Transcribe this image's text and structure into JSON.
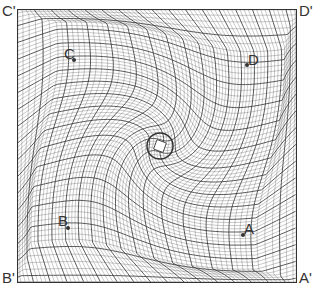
{
  "diagram": {
    "type": "distorted-grid-mesh",
    "colors": {
      "line": "#333333",
      "background": "#ffffff"
    },
    "corners": [
      {
        "id": "c-prime",
        "label": "C'"
      },
      {
        "id": "d-prime",
        "label": "D'"
      },
      {
        "id": "b-prime",
        "label": "B'"
      },
      {
        "id": "a-prime",
        "label": "A'"
      }
    ],
    "points": [
      {
        "id": "c",
        "label": "C"
      },
      {
        "id": "d",
        "label": "D"
      },
      {
        "id": "b",
        "label": "B"
      },
      {
        "id": "a",
        "label": "A"
      }
    ]
  }
}
